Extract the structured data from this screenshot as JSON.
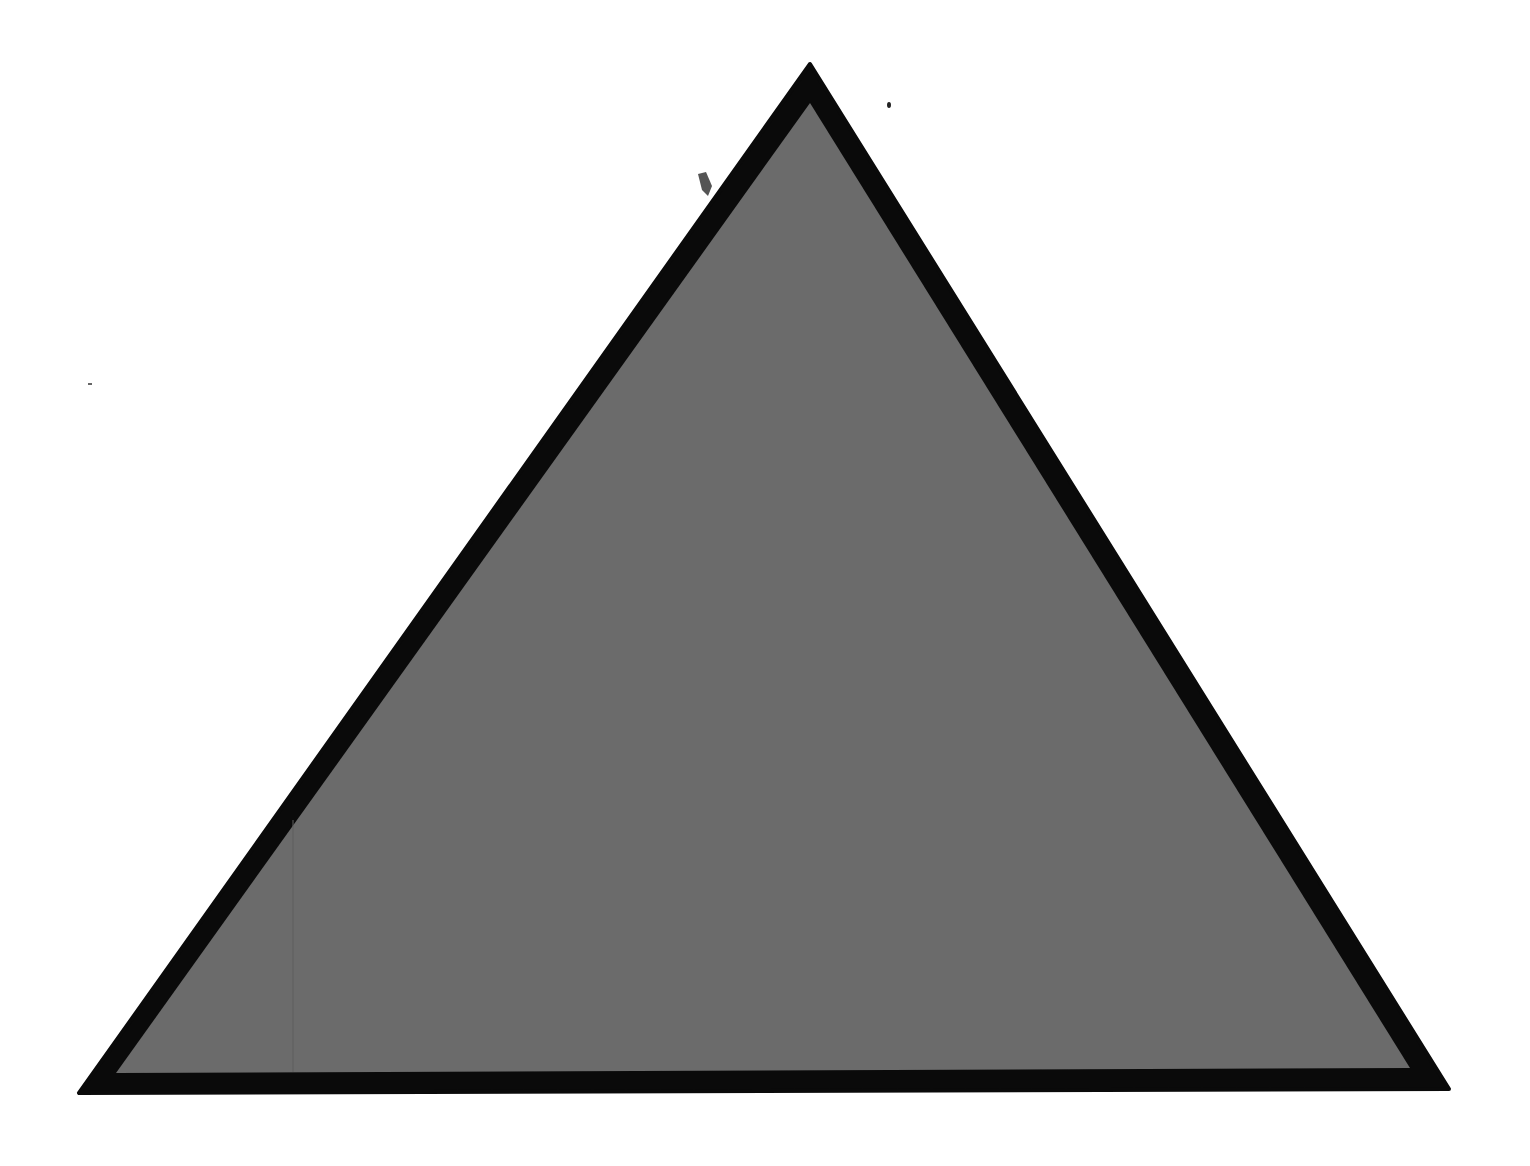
{
  "shape": {
    "type": "triangle",
    "fill_color": "#6b6b6b",
    "stroke_color": "#0a0a0a",
    "background_color": "#ffffff",
    "outer_points": "810,64 79,1093 1449,1089",
    "inner_points": "810,103 116,1073 1410,1068"
  }
}
